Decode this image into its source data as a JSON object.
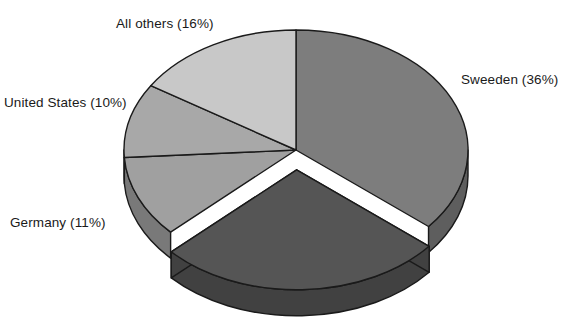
{
  "chart_data": {
    "type": "pie",
    "title": "",
    "subtitle": "",
    "xlabel": "",
    "ylabel": "",
    "grid": false,
    "legend_position": "none",
    "style": "3d-exploded-pie",
    "label_format": "name (percent%)",
    "background_color": "#ffffff",
    "outline_color": "#1a1a1a",
    "categories": [
      "Sweeden",
      "Unlabeled slice",
      "Germany",
      "United States",
      "All others"
    ],
    "values": [
      36,
      27,
      11,
      10,
      16
    ],
    "labels": [
      "Sweeden (36%)",
      "",
      "Germany (11%)",
      "United States (10%)",
      "All others (16%)"
    ],
    "slices": [
      {
        "name": "Sweeden",
        "label": "Sweeden (36%)",
        "percent": 36,
        "color": "#7d7d7d",
        "side_color": "#5e5e5e",
        "exploded": false,
        "label_position": "right"
      },
      {
        "name": "Unlabeled slice",
        "label": "",
        "percent": 27,
        "color": "#555555",
        "side_color": "#414141",
        "exploded": true,
        "label_position": "none"
      },
      {
        "name": "Germany",
        "label": "Germany (11%)",
        "percent": 11,
        "color": "#a0a0a0",
        "side_color": "#797979",
        "exploded": false,
        "label_position": "left"
      },
      {
        "name": "United States",
        "label": "United States (10%)",
        "percent": 10,
        "color": "#a8a8a8",
        "side_color": "#818181",
        "exploded": false,
        "label_position": "left"
      },
      {
        "name": "All others",
        "label": "All others (16%)",
        "percent": 16,
        "color": "#c8c8c8",
        "side_color": "#9b9b9b",
        "exploded": false,
        "label_position": "top-left"
      }
    ]
  },
  "labels": {
    "all_others": "All others (16%)",
    "sweeden": "Sweeden (36%)",
    "united_states": "United States (10%)",
    "germany": "Germany (11%)"
  }
}
